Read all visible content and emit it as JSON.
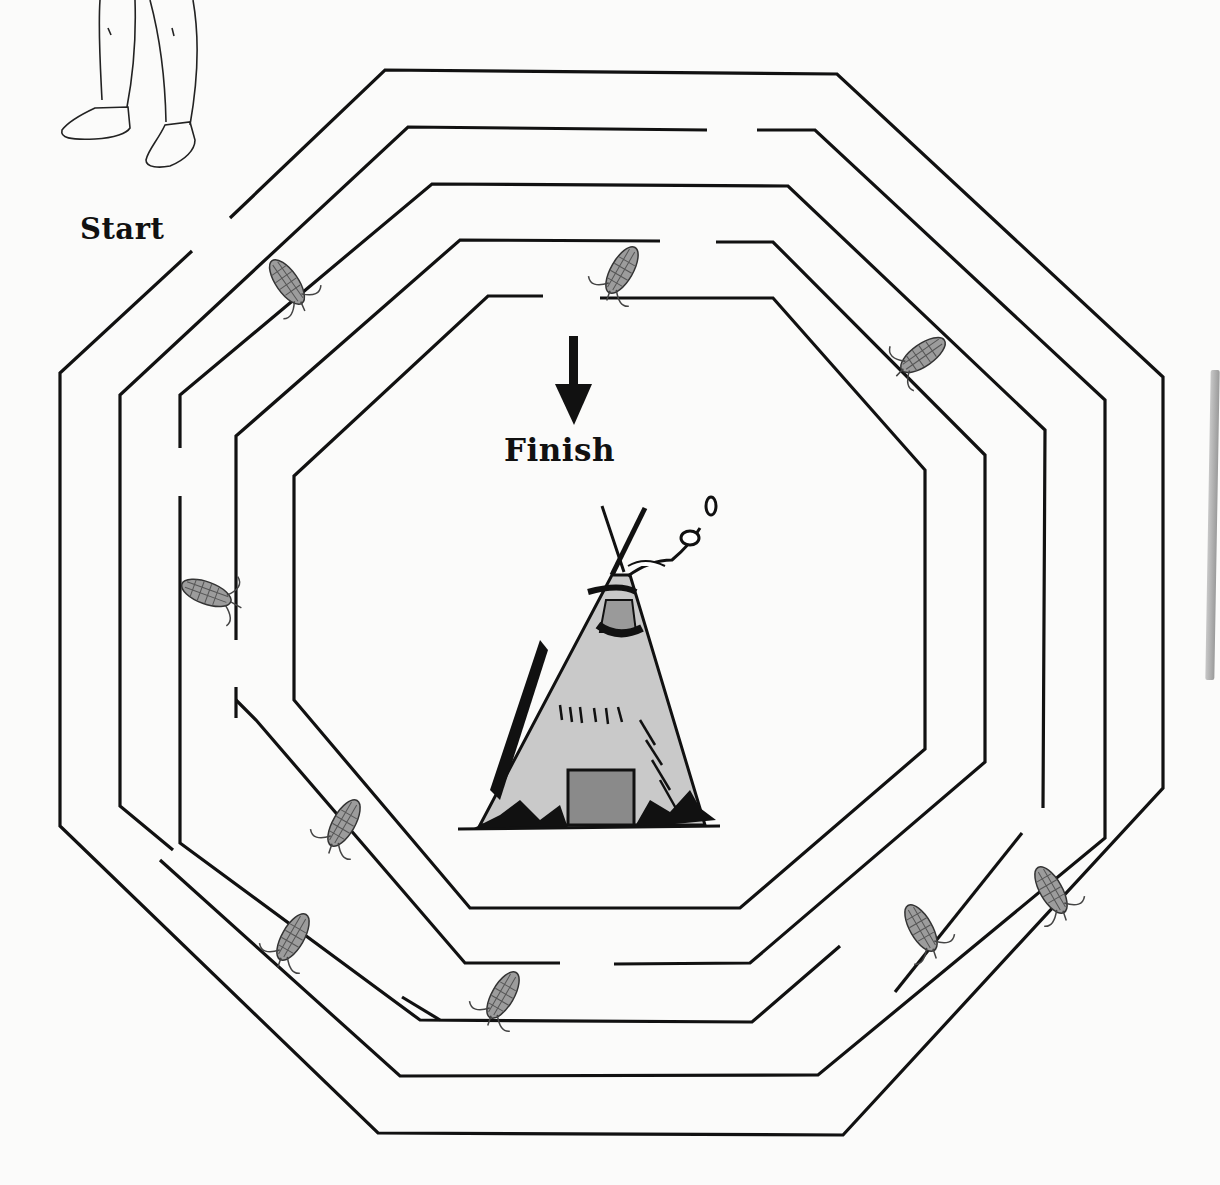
{
  "worksheet": {
    "type": "maze",
    "theme": "corn harvest to teepee",
    "start_label": "Start",
    "finish_label": "Finish"
  },
  "maze": {
    "shape": "octagon",
    "ring_count": 5,
    "stroke_color": "#111111",
    "background_color": "#fbfbfa"
  },
  "illustrations": [
    {
      "name": "child-legs-moccasins",
      "position": "top-left"
    },
    {
      "name": "teepee",
      "position": "center"
    },
    {
      "name": "finish-arrow",
      "position": "center-top"
    }
  ],
  "corn_ears": [
    {
      "id": 1,
      "x": 287,
      "y": 282,
      "angle": 55
    },
    {
      "id": 2,
      "x": 622,
      "y": 270,
      "angle": -60
    },
    {
      "id": 3,
      "x": 923,
      "y": 355,
      "angle": -35
    },
    {
      "id": 4,
      "x": 212,
      "y": 595,
      "angle": 20
    },
    {
      "id": 5,
      "x": 344,
      "y": 823,
      "angle": -60
    },
    {
      "id": 6,
      "x": 293,
      "y": 937,
      "angle": -60
    },
    {
      "id": 7,
      "x": 503,
      "y": 995,
      "angle": -60
    },
    {
      "id": 8,
      "x": 921,
      "y": 928,
      "angle": 60
    },
    {
      "id": 9,
      "x": 1051,
      "y": 890,
      "angle": 60
    }
  ]
}
